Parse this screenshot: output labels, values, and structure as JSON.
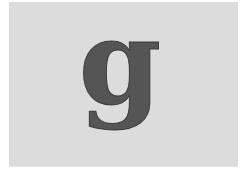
{
  "image": {
    "letter": "g",
    "letter_color": "#555555",
    "letter_outline": "#3a3a3a",
    "background_color": "#dcdcdc",
    "page_color": "#ffffff"
  }
}
